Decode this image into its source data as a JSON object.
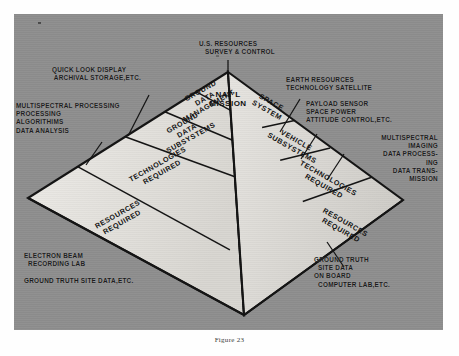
{
  "figure": {
    "caption": "Figure 23",
    "apex_label": "NAT'L\nMISSION",
    "top_callout": "U.S. RESOURCES\n   SURVEY & CONTROL"
  },
  "pyramid": {
    "left_face": [
      {
        "id": "ground-data-management",
        "text": "GROUND\nDATA\nMANAGEMENT"
      },
      {
        "id": "ground-data-subsystems",
        "text": "GROUND\nDATA\nSUBSYSTEMS"
      },
      {
        "id": "technologies-required-left",
        "text": "TECHNOLOGIES\nREQUIRED"
      },
      {
        "id": "resources-required-left",
        "text": "RESOURCES\nREQUIRED"
      }
    ],
    "right_face": [
      {
        "id": "space-system",
        "text": "SPACE\nSYSTEM"
      },
      {
        "id": "vehicle-subsystems",
        "text": "VEHICLE\nSUBSYSTEMS"
      },
      {
        "id": "technologies-required-right",
        "text": "TECHNOLOGIES\nREQUIRED"
      },
      {
        "id": "resources-required-right",
        "text": "RESOURCES\nREQUIRED"
      }
    ]
  },
  "callouts": {
    "left_top": "QUICK LOOK DISPLAY\n ARCHIVAL STORAGE,ETC.",
    "left_mid": "MULTISPECTRAL PROCESSING\nPROCESSING\nALGORITHIMS\nDATA ANALYSIS",
    "left_bottom": "ELECTRON BEAM\n  RECORDING LAB\n\nGROUND TRUTH SITE DATA,ETC.",
    "right_top": "EARTH RESOURCES\nTECHNOLOGY SATELLITE",
    "right_upper_mid": "PAYLOAD SENSOR\nSPACE POWER\nATTITUDE CONTROL,ETC.",
    "right_mid": "MULTISPECTRAL\nIMAGING\nDATA PROCESS-\nING\nDATA TRANS-\nMISSION",
    "right_bottom": "GROUND TRUTH\n  SITE DATA\nON BOARD\n  COMPUTER LAB,ETC."
  },
  "colors": {
    "plate_background": "#8e8e8e",
    "face_light": "#e2e0dc",
    "face_mid": "#d6d4d0",
    "outline": "#121212",
    "text": "#141414",
    "page": "#fefefe"
  }
}
